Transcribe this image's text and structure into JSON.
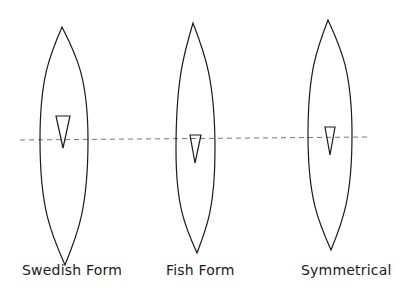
{
  "diagram": {
    "stroke_color": "#1a1a1a",
    "waterline_color": "#777777",
    "waterline": {
      "x1": 20,
      "y1": 140,
      "x2": 370,
      "y2": 137,
      "style": "dashed"
    },
    "hulls": [
      {
        "label": "Swedish Form",
        "label_x": 22,
        "top": [
          62,
          27
        ],
        "bottom": [
          65,
          265
        ],
        "max_width_y": 140,
        "left_x": 40,
        "right_x": 88,
        "marker": {
          "top_y": 116,
          "left_x": 56,
          "right_x": 70,
          "tip": [
            63,
            148
          ],
          "icon": "triangle-marker"
        }
      },
      {
        "label": "Fish Form",
        "label_x": 166,
        "top": [
          193,
          23
        ],
        "bottom": [
          197,
          253
        ],
        "max_width_y": 150,
        "left_x": 176,
        "right_x": 215,
        "marker": {
          "top_y": 135,
          "left_x": 190,
          "right_x": 201,
          "tip": [
            195,
            163
          ],
          "icon": "triangle-marker"
        }
      },
      {
        "label": "Symmetrical",
        "label_x": 301,
        "top": [
          328,
          20
        ],
        "bottom": [
          331,
          250
        ],
        "max_width_y": 135,
        "left_x": 308,
        "right_x": 352,
        "marker": {
          "top_y": 127,
          "left_x": 325,
          "right_x": 335,
          "tip": [
            330,
            155
          ],
          "icon": "triangle-marker"
        }
      }
    ]
  }
}
